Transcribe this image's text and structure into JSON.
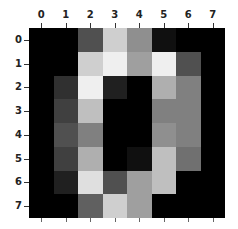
{
  "chart_data": {
    "type": "heatmap",
    "title": "",
    "xlabel": "",
    "ylabel": "",
    "colormap": "gray",
    "vmin": 0,
    "vmax": 16,
    "x_tick_labels": [
      "0",
      "1",
      "2",
      "3",
      "4",
      "5",
      "6",
      "7"
    ],
    "y_tick_labels": [
      "0",
      "1",
      "2",
      "3",
      "4",
      "5",
      "6",
      "7"
    ],
    "x_axis_position": "top",
    "grid": false,
    "legend": false,
    "values": [
      [
        0,
        0,
        5,
        13,
        9,
        1,
        0,
        0
      ],
      [
        0,
        0,
        13,
        15,
        10,
        15,
        5,
        0
      ],
      [
        0,
        3,
        15,
        2,
        0,
        11,
        8,
        0
      ],
      [
        0,
        4,
        12,
        0,
        0,
        8,
        8,
        0
      ],
      [
        0,
        5,
        8,
        0,
        0,
        9,
        8,
        0
      ],
      [
        0,
        4,
        11,
        0,
        1,
        12,
        7,
        0
      ],
      [
        0,
        2,
        14,
        5,
        10,
        12,
        0,
        0
      ],
      [
        0,
        0,
        6,
        13,
        10,
        0,
        0,
        0
      ]
    ]
  }
}
